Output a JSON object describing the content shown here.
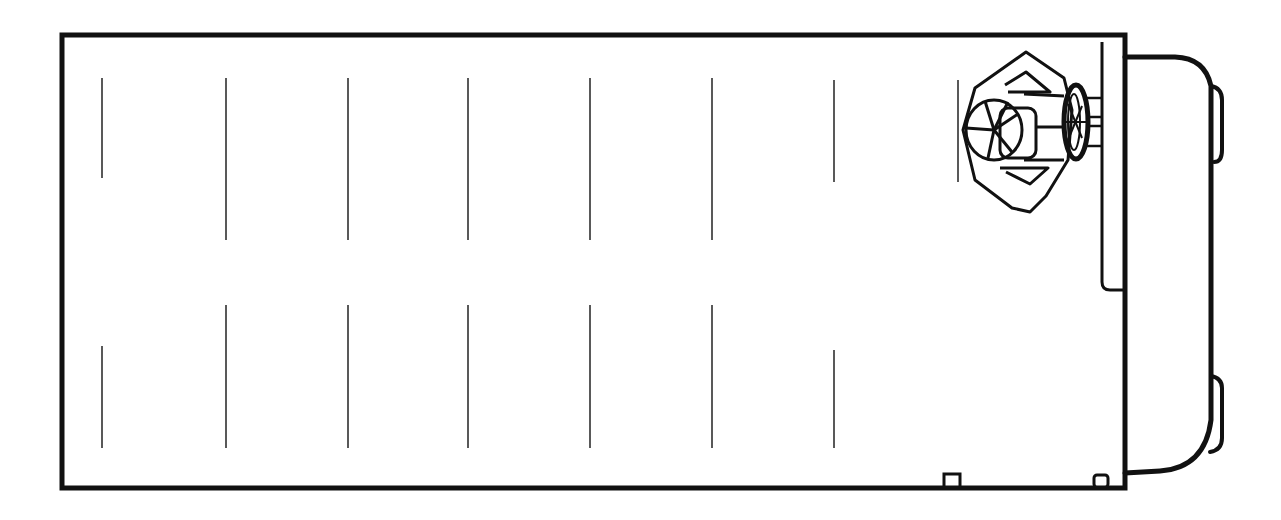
{
  "diagram": {
    "type": "vehicle-floor-plan-top-view",
    "colors": {
      "stroke": "#111111",
      "background": "#ffffff"
    },
    "body": {
      "x": 62,
      "y": 35,
      "width": 1063,
      "height": 453,
      "stroke_width": 5
    },
    "cab": {
      "x1": 1125,
      "y_top": 57,
      "y_bottom": 470,
      "x_right": 1215,
      "stroke_width": 5
    },
    "seat_markers_top": [
      {
        "x": 102,
        "y1": 78,
        "y2": 178
      },
      {
        "x": 226,
        "y1": 78,
        "y2": 240
      },
      {
        "x": 348,
        "y1": 78,
        "y2": 240
      },
      {
        "x": 468,
        "y1": 78,
        "y2": 240
      },
      {
        "x": 590,
        "y1": 78,
        "y2": 240
      },
      {
        "x": 712,
        "y1": 78,
        "y2": 240
      },
      {
        "x": 834,
        "y1": 80,
        "y2": 182
      },
      {
        "x": 958,
        "y1": 80,
        "y2": 182
      }
    ],
    "seat_markers_bottom": [
      {
        "x": 102,
        "y1": 346,
        "y2": 448
      },
      {
        "x": 226,
        "y1": 305,
        "y2": 448
      },
      {
        "x": 348,
        "y1": 305,
        "y2": 448
      },
      {
        "x": 468,
        "y1": 305,
        "y2": 448
      },
      {
        "x": 590,
        "y1": 305,
        "y2": 448
      },
      {
        "x": 712,
        "y1": 305,
        "y2": 448
      },
      {
        "x": 834,
        "y1": 350,
        "y2": 448
      }
    ],
    "driver": {
      "label": "driver-seat-with-steering-wheel",
      "cx": 1030,
      "cy": 130
    },
    "icons": [
      "steering-wheel-icon",
      "driver-head-icon",
      "seat-icon",
      "door-step-icon"
    ]
  }
}
